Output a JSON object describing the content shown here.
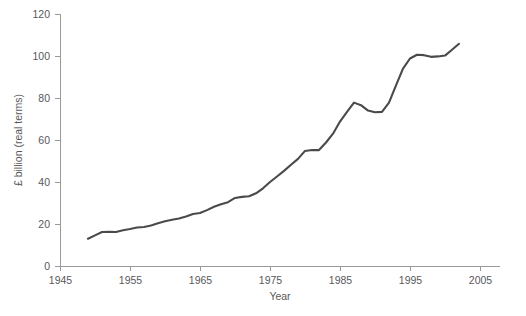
{
  "chart_data": {
    "type": "line",
    "title": "",
    "xlabel": "Year",
    "ylabel": "£ billion (real terms)",
    "xlim": [
      1945,
      2005
    ],
    "ylim": [
      0,
      120
    ],
    "grid": false,
    "legend": null,
    "legend_position": "none",
    "line_color": "#4a4a4a",
    "axis_color": "#9a9a9c",
    "text_color": "#58585a",
    "background_color": "#ffffff",
    "xticks": [
      1945,
      1955,
      1965,
      1975,
      1985,
      1995,
      2005
    ],
    "xtick_labels": [
      "1945",
      "1955",
      "1965",
      "1975",
      "1985",
      "1995",
      "2005"
    ],
    "yticks": [
      0,
      20,
      40,
      60,
      80,
      100,
      120
    ],
    "ytick_labels": [
      "0",
      "20",
      "40",
      "60",
      "80",
      "100",
      "120"
    ],
    "series": [
      {
        "name": "£ billion (real terms)",
        "x": [
          1949,
          1950,
          1951,
          1952,
          1953,
          1954,
          1955,
          1956,
          1957,
          1958,
          1959,
          1960,
          1961,
          1962,
          1963,
          1964,
          1965,
          1966,
          1967,
          1968,
          1969,
          1970,
          1971,
          1972,
          1973,
          1974,
          1975,
          1976,
          1977,
          1978,
          1979,
          1980,
          1981,
          1982,
          1983,
          1984,
          1985,
          1986,
          1987,
          1988,
          1989,
          1990,
          1991,
          1992,
          1993,
          1994,
          1995,
          1996,
          1997,
          1998,
          1999,
          2000,
          2001,
          2002
        ],
        "values": [
          13.0,
          14.6,
          16.2,
          16.3,
          16.2,
          17.0,
          17.6,
          18.3,
          18.6,
          19.3,
          20.4,
          21.3,
          22.0,
          22.6,
          23.6,
          24.8,
          25.2,
          26.6,
          28.2,
          29.4,
          30.4,
          32.4,
          32.9,
          33.2,
          34.6,
          37.0,
          40.0,
          42.6,
          45.3,
          48.2,
          51.0,
          54.8,
          55.2,
          55.2,
          58.8,
          63.0,
          68.8,
          73.4,
          77.8,
          76.6,
          74.0,
          73.2,
          73.4,
          77.8,
          86.0,
          94.0,
          98.8,
          100.6,
          100.4,
          99.6,
          99.8,
          100.2,
          103.0,
          105.8
        ]
      }
    ]
  }
}
